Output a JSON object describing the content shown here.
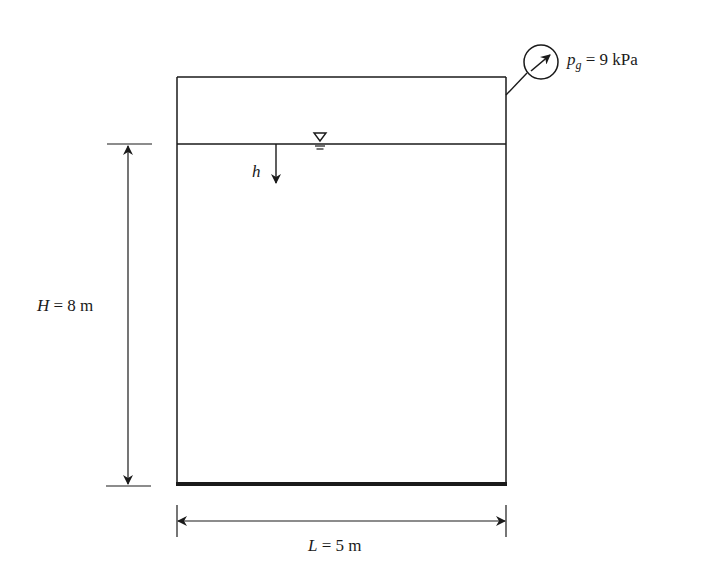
{
  "diagram": {
    "type": "pressurized-tank",
    "colors": {
      "stroke": "#1a1a1a",
      "background": "#ffffff"
    },
    "gauge": {
      "symbol": "p",
      "subscript": "g",
      "equals": " = ",
      "value": "9 kPa",
      "icon": "pressure-gauge-icon"
    },
    "water_surface": {
      "icon": "free-surface-triangle-icon"
    },
    "depth_arrow": {
      "label": "h"
    },
    "height_dimension": {
      "symbol": "H",
      "rest": " = 8 m"
    },
    "length_dimension": {
      "symbol": "L",
      "rest": " = 5 m"
    }
  }
}
